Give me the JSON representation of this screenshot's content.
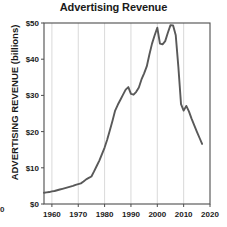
{
  "chart_data": {
    "type": "line",
    "title": "Advertising Revenue",
    "xlabel": "",
    "ylabel": "ADVERTISING REVENUE (billions)",
    "xlim": [
      1957,
      2020
    ],
    "ylim": [
      0,
      50
    ],
    "grid": "vertical-only",
    "legend": "none",
    "y_ticks": [
      0,
      10,
      20,
      30,
      40,
      50
    ],
    "y_tick_labels": [
      "$0",
      "$10",
      "$20",
      "$30",
      "$40",
      "$50"
    ],
    "x_ticks": [
      1960,
      1970,
      1980,
      1990,
      2000,
      2010,
      2020
    ],
    "x_tick_labels": [
      "1960",
      "1970",
      "1980",
      "1990",
      "2000",
      "2010",
      "2020"
    ],
    "line_color": "#595959",
    "series": [
      {
        "name": "Advertising Revenue",
        "x": [
          1957,
          1958,
          1959,
          1960,
          1961,
          1962,
          1963,
          1964,
          1965,
          1966,
          1967,
          1968,
          1969,
          1970,
          1971,
          1972,
          1973,
          1974,
          1975,
          1976,
          1977,
          1978,
          1979,
          1980,
          1981,
          1982,
          1983,
          1984,
          1985,
          1986,
          1987,
          1988,
          1989,
          1990,
          1991,
          1992,
          1993,
          1994,
          1995,
          1996,
          1997,
          1998,
          1999,
          2000,
          2001,
          2002,
          2003,
          2004,
          2005,
          2006,
          2007,
          2008,
          2009,
          2010,
          2011,
          2012,
          2013,
          2014,
          2015,
          2016,
          2017
        ],
        "values": [
          3.1,
          3.2,
          3.3,
          3.5,
          3.6,
          3.8,
          4.0,
          4.2,
          4.4,
          4.6,
          4.8,
          5.0,
          5.3,
          5.5,
          5.7,
          6.2,
          6.8,
          7.2,
          7.6,
          9.0,
          10.5,
          12.0,
          13.8,
          15.6,
          17.8,
          20.4,
          23.0,
          25.8,
          27.4,
          28.8,
          30.2,
          31.6,
          32.3,
          30.4,
          30.2,
          31.0,
          32.2,
          34.4,
          36.1,
          38.0,
          41.3,
          44.3,
          46.6,
          48.7,
          44.3,
          44.1,
          45.0,
          47.3,
          49.4,
          49.3,
          46.6,
          37.8,
          27.6,
          25.8,
          27.1,
          25.6,
          23.6,
          21.8,
          20.0,
          18.3,
          16.6
        ]
      }
    ]
  },
  "artifacts": {
    "stray_left_digit": "0"
  }
}
